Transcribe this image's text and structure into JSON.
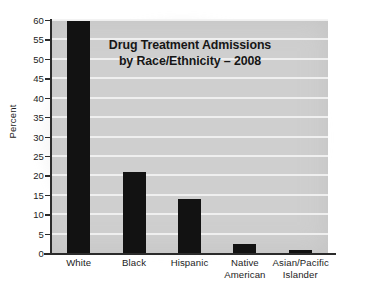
{
  "chart_data": {
    "type": "bar",
    "title": "Drug Treatment Admissions by Race/Ethnicity – 2008",
    "title_line1": "Drug Treatment Admissions",
    "title_line2": "by Race/Ethnicity – 2008",
    "xlabel": "",
    "ylabel": "Percent",
    "ylim": [
      0,
      60
    ],
    "ytick_step": 5,
    "yticks": [
      0,
      5,
      10,
      15,
      20,
      25,
      30,
      35,
      40,
      45,
      50,
      55,
      60
    ],
    "grid": "horizontal",
    "legend": "none",
    "bar_color": "#121212",
    "plot_background": "#cfcfcf",
    "gridline_color": "#f2f2f2",
    "categories": [
      "White",
      "Black",
      "Hispanic",
      "Native American",
      "Asian/Pacific Islander"
    ],
    "category_lines": [
      [
        "White"
      ],
      [
        "Black"
      ],
      [
        "Hispanic"
      ],
      [
        "Native",
        "American"
      ],
      [
        "Asian/Pacific",
        "Islander"
      ]
    ],
    "values": [
      59.7,
      20.9,
      13.8,
      2.2,
      0.8
    ]
  }
}
